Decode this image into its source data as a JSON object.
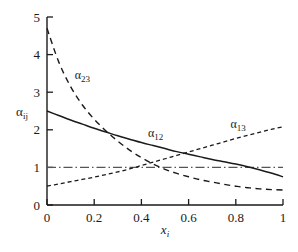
{
  "chart_data": {
    "type": "line",
    "title": "",
    "xlabel": "x_i",
    "ylabel": "alpha_ij",
    "xlim": [
      0,
      1
    ],
    "ylim": [
      0,
      5
    ],
    "grid": false,
    "legend": "inline-curve-labels",
    "xticks": [
      "0",
      "0.2",
      "0.4",
      "0.6",
      "0.8",
      "1"
    ],
    "xtick_values": [
      0,
      0.2,
      0.4,
      0.6,
      0.8,
      1
    ],
    "yticks": [
      "0",
      "1",
      "2",
      "3",
      "4",
      "5"
    ],
    "ytick_values": [
      0,
      1,
      2,
      3,
      4,
      5
    ],
    "x": [
      0,
      0.05,
      0.1,
      0.15,
      0.2,
      0.25,
      0.3,
      0.35,
      0.4,
      0.45,
      0.5,
      0.55,
      0.6,
      0.65,
      0.7,
      0.75,
      0.8,
      0.85,
      0.9,
      0.95,
      1
    ],
    "series": [
      {
        "name": "alpha_12",
        "label": "α",
        "subscript": "12",
        "style": "solid",
        "values": [
          2.5,
          2.38,
          2.26,
          2.15,
          2.04,
          1.94,
          1.84,
          1.75,
          1.66,
          1.58,
          1.5,
          1.42,
          1.35,
          1.28,
          1.21,
          1.15,
          1.09,
          1.02,
          0.94,
          0.85,
          0.75
        ]
      },
      {
        "name": "alpha_23",
        "label": "α",
        "subscript": "23",
        "style": "long-dash",
        "values": [
          4.7,
          3.8,
          3.15,
          2.66,
          2.28,
          1.97,
          1.7,
          1.46,
          1.26,
          1.09,
          0.95,
          0.84,
          0.75,
          0.67,
          0.61,
          0.55,
          0.5,
          0.46,
          0.43,
          0.41,
          0.4
        ]
      },
      {
        "name": "alpha_13",
        "label": "α",
        "subscript": "13",
        "style": "short-dash",
        "values": [
          0.5,
          0.56,
          0.62,
          0.68,
          0.74,
          0.81,
          0.88,
          0.96,
          1.05,
          1.14,
          1.23,
          1.32,
          1.41,
          1.5,
          1.59,
          1.68,
          1.77,
          1.85,
          1.93,
          2.01,
          2.08
        ]
      }
    ],
    "reference_lines": [
      {
        "name": "unity-line",
        "orientation": "horizontal",
        "value": 1,
        "style": "dash-dot"
      }
    ],
    "annotations": [
      {
        "name": "alpha-23-label",
        "text": "α",
        "subscript": "23",
        "x": 0.15,
        "y": 3.35
      },
      {
        "name": "alpha-12-label",
        "text": "α",
        "subscript": "12",
        "x": 0.46,
        "y": 1.8
      },
      {
        "name": "alpha-13-label",
        "text": "α",
        "subscript": "13",
        "x": 0.81,
        "y": 2.05
      }
    ],
    "colors": {
      "axis": "#1a1a1a",
      "curve": "#1a1a1a",
      "reference": "#555555",
      "background": "#ffffff"
    }
  }
}
